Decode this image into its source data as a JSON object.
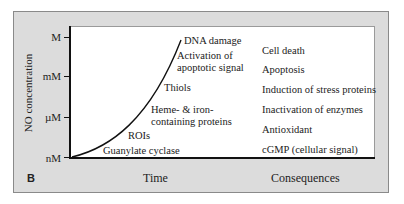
{
  "panel": {
    "letter": "B",
    "background": "#dcdcdc"
  },
  "axes": {
    "ylabel": "NO concentration",
    "xlabel_left": "Time",
    "xlabel_right": "Consequences",
    "yticks": [
      "M",
      "mM",
      "µM",
      "nM"
    ]
  },
  "targets": [
    {
      "label_line1": "DNA damage",
      "label_line2": ""
    },
    {
      "label_line1": "Activation of",
      "label_line2": "apoptotic signal"
    },
    {
      "label_line1": "Thiols",
      "label_line2": ""
    },
    {
      "label_line1": "Heme- & iron-",
      "label_line2": "containing proteins"
    },
    {
      "label_line1": "ROIs",
      "label_line2": ""
    },
    {
      "label_line1": "Guanylate cyclase",
      "label_line2": ""
    }
  ],
  "consequences": [
    "Cell death",
    "Apoptosis",
    "Induction of stress proteins",
    "Inactivation of enzymes",
    "Antioxidant",
    "cGMP (cellular signal)"
  ]
}
